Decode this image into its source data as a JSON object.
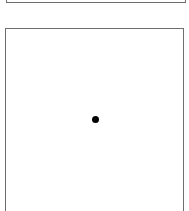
{
  "panels": [
    {
      "id": "top",
      "visible_part": "bottom edge",
      "border_color": "#6e6e6e"
    },
    {
      "id": "main",
      "visible_part": "top and sides",
      "border_color": "#6e6e6e"
    }
  ],
  "marker": {
    "shape": "dot",
    "color": "#000000"
  }
}
